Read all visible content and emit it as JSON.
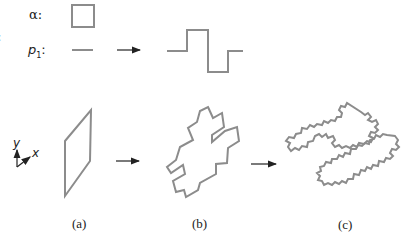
{
  "figure": {
    "rule_labels": {
      "axiom": "α:",
      "production": "p",
      "production_sub": "1",
      "production_colon": ":",
      "edge_fragment": ":"
    },
    "axes_icon": {
      "y_label": "y",
      "x_label": "x"
    },
    "captions": [
      "(a)",
      "(b)",
      "(c)"
    ],
    "colors": {
      "stroke": "#8c8c8c",
      "arrow": "#222222",
      "text": "#222222"
    },
    "elements": [
      {
        "id": "axiom-square",
        "desc": "square axiom shape"
      },
      {
        "id": "production-line",
        "desc": "straight segment"
      },
      {
        "id": "production-result",
        "desc": "square-wave segment replacement"
      },
      {
        "id": "shape-a",
        "desc": "parallelogram (axiom in 3D view)"
      },
      {
        "id": "shape-b",
        "desc": "first iteration, cross-like outline"
      },
      {
        "id": "shape-c",
        "desc": "second iteration, fractal outline"
      }
    ]
  }
}
